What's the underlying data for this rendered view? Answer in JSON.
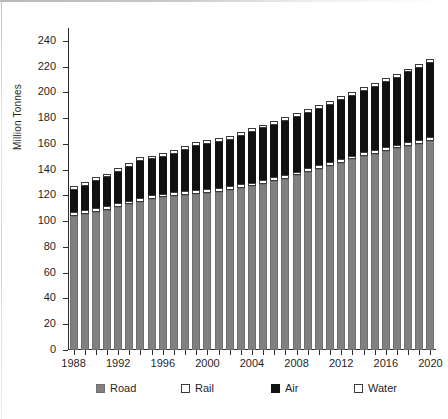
{
  "chart_data": {
    "type": "bar",
    "stacked": true,
    "title": "",
    "xlabel": "",
    "ylabel": "Million Tonnes",
    "ylim": [
      0,
      250
    ],
    "ytick_values": [
      0,
      20,
      40,
      60,
      80,
      100,
      120,
      140,
      160,
      180,
      200,
      220,
      240
    ],
    "ytick_labels": [
      "0",
      "20",
      "40",
      "60",
      "80",
      "100",
      "120",
      "140",
      "160",
      "180",
      "200",
      "220",
      "240"
    ],
    "grid": false,
    "legend_position": "bottom",
    "categories": [
      "1988",
      "1989",
      "1990",
      "1991",
      "1992",
      "1993",
      "1994",
      "1995",
      "1996",
      "1997",
      "1998",
      "1999",
      "2000",
      "2001",
      "2002",
      "2003",
      "2004",
      "2005",
      "2006",
      "2007",
      "2008",
      "2009",
      "2010",
      "2011",
      "2012",
      "2013",
      "2014",
      "2015",
      "2016",
      "2017",
      "2018",
      "2019",
      "2020"
    ],
    "xtick_labels": [
      "1988",
      "1992",
      "1996",
      "2000",
      "2004",
      "2008",
      "2012",
      "2016",
      "2020"
    ],
    "xtick_categories": [
      "1988",
      "1992",
      "1996",
      "2000",
      "2004",
      "2008",
      "2012",
      "2016",
      "2020"
    ],
    "series": [
      {
        "name": "Road",
        "color": "#808080",
        "values": [
          104,
          105.5,
          107,
          109,
          111,
          113,
          115,
          117.5,
          118.5,
          119.5,
          120.5,
          121.5,
          122,
          123,
          124,
          125.5,
          127,
          129,
          131,
          133,
          135.5,
          138,
          140.5,
          143,
          145.5,
          148,
          150.5,
          152.5,
          154.5,
          156.5,
          158.5,
          160,
          162
        ]
      },
      {
        "name": "Rail",
        "color": "#ffffff",
        "values": [
          3,
          3,
          3,
          3,
          3,
          3,
          3,
          3,
          3,
          3,
          3,
          3,
          3,
          3,
          3,
          3,
          3,
          3,
          3,
          3,
          3,
          3,
          3,
          3,
          3,
          3,
          3,
          3,
          3,
          3,
          3,
          3,
          3
        ]
      },
      {
        "name": "Air",
        "color": "#111111",
        "values": [
          17,
          19,
          21.5,
          22,
          24,
          26,
          29,
          27.5,
          28.5,
          29.5,
          31.5,
          34,
          35,
          35.5,
          36,
          38,
          39.5,
          40,
          41,
          42,
          42.5,
          43,
          43.5,
          44.5,
          45.5,
          46.5,
          47.5,
          49,
          50.5,
          52,
          54,
          56,
          58
        ]
      },
      {
        "name": "Water",
        "color": "#ffffff",
        "values": [
          3,
          3,
          3,
          3,
          3,
          3,
          3,
          3,
          3,
          3,
          3,
          3,
          3,
          3,
          3,
          3,
          3,
          3,
          3,
          3,
          3,
          3,
          3,
          3,
          3,
          3,
          3,
          3,
          3,
          3,
          3,
          3,
          3
        ]
      }
    ],
    "totals": [
      127,
      130.5,
      134.5,
      137,
      141,
      145,
      150,
      151,
      153,
      155,
      158,
      161.5,
      163,
      164.5,
      166,
      169.5,
      172.5,
      175,
      178,
      181,
      184,
      187,
      190,
      193.5,
      197,
      200.5,
      204,
      207.5,
      211,
      214.5,
      218.5,
      222,
      226
    ],
    "legend": [
      {
        "label": "Road",
        "swatch": "road"
      },
      {
        "label": "Rail",
        "swatch": "rail"
      },
      {
        "label": "Air",
        "swatch": "air"
      },
      {
        "label": "Water",
        "swatch": "water"
      }
    ]
  }
}
